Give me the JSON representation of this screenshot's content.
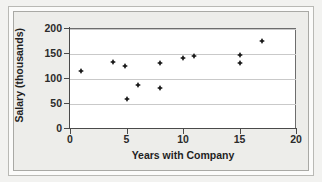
{
  "chart_data": {
    "type": "scatter",
    "title": "",
    "xlabel": "Years with Company",
    "ylabel": "Salary (thousands)",
    "xlim": [
      0,
      20
    ],
    "ylim": [
      0,
      200
    ],
    "xticks": [
      "0",
      "5",
      "10",
      "15",
      "20"
    ],
    "yticks": [
      "0",
      "50",
      "100",
      "150",
      "200"
    ],
    "xtick_values": [
      0,
      5,
      10,
      15,
      20
    ],
    "ytick_values": [
      0,
      50,
      100,
      150,
      200
    ],
    "grid": "horizontal",
    "legend": "none",
    "marker": "diamond",
    "marker_color": "#1a1a1a",
    "points": [
      {
        "x": 1.0,
        "y": 117
      },
      {
        "x": 3.8,
        "y": 134
      },
      {
        "x": 4.9,
        "y": 127
      },
      {
        "x": 5.0,
        "y": 61
      },
      {
        "x": 6.0,
        "y": 89
      },
      {
        "x": 8.0,
        "y": 133
      },
      {
        "x": 8.0,
        "y": 82
      },
      {
        "x": 10.0,
        "y": 142
      },
      {
        "x": 11.0,
        "y": 146
      },
      {
        "x": 15.0,
        "y": 148
      },
      {
        "x": 15.0,
        "y": 132
      },
      {
        "x": 17.0,
        "y": 176
      }
    ]
  },
  "figure": {
    "background_color": "#f2f2f0",
    "plot_background_color": "#ffffff",
    "gridline_color": "#c9c9c9",
    "axis_color": "#4a4a4a"
  }
}
